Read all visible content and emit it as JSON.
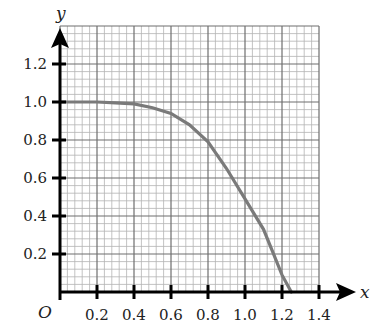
{
  "chart_data": {
    "type": "line",
    "title": "",
    "xlabel": "x",
    "ylabel": "y",
    "origin_label": "O",
    "xlim": [
      0,
      1.4
    ],
    "ylim": [
      0,
      1.4
    ],
    "grid": true,
    "grid_major_step": 0.2,
    "grid_minor_step": 0.04,
    "x_ticks": [
      "0.2",
      "0.4",
      "0.6",
      "0.8",
      "1.0",
      "1.2",
      "1.4"
    ],
    "y_ticks": [
      "0.2",
      "0.4",
      "0.6",
      "0.8",
      "1.0",
      "1.2"
    ],
    "series": [
      {
        "name": "curve",
        "color": "#808080",
        "x": [
          0,
          0.1,
          0.2,
          0.3,
          0.4,
          0.5,
          0.6,
          0.7,
          0.8,
          0.9,
          1.0,
          1.05,
          1.1,
          1.15,
          1.2,
          1.25
        ],
        "y": [
          1.0,
          1.0,
          1.0,
          0.995,
          0.99,
          0.97,
          0.94,
          0.88,
          0.79,
          0.65,
          0.49,
          0.41,
          0.33,
          0.21,
          0.09,
          0.0
        ]
      }
    ],
    "legend": null
  },
  "colors": {
    "axis": "#000000",
    "grid_major": "#6e6e6e",
    "grid_minor": "#b4b4b4",
    "curve": "#7a7a7a"
  }
}
